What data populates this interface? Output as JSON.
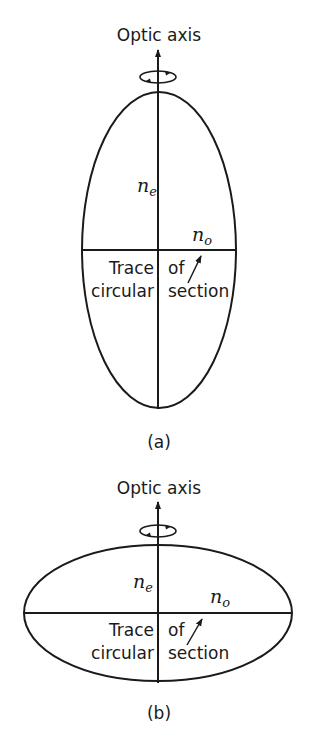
{
  "figure_a": {
    "axis_label": "Optic axis",
    "ne_label": "n",
    "ne_sub": "e",
    "no_label": "n",
    "no_sub": "o",
    "trace_line1_left": "Trace",
    "trace_line1_right": "of",
    "trace_line2_left": "circular",
    "trace_line2_right": "section",
    "caption": "(a)",
    "shape": "prolate ellipsoid"
  },
  "figure_b": {
    "axis_label": "Optic axis",
    "ne_label": "n",
    "ne_sub": "e",
    "no_label": "n",
    "no_sub": "o",
    "trace_line1_left": "Trace",
    "trace_line1_right": "of",
    "trace_line2_left": "circular",
    "trace_line2_right": "section",
    "caption": "(b)",
    "shape": "oblate ellipsoid"
  },
  "colors": {
    "ink": "#1a1a1a",
    "background": "#ffffff"
  }
}
